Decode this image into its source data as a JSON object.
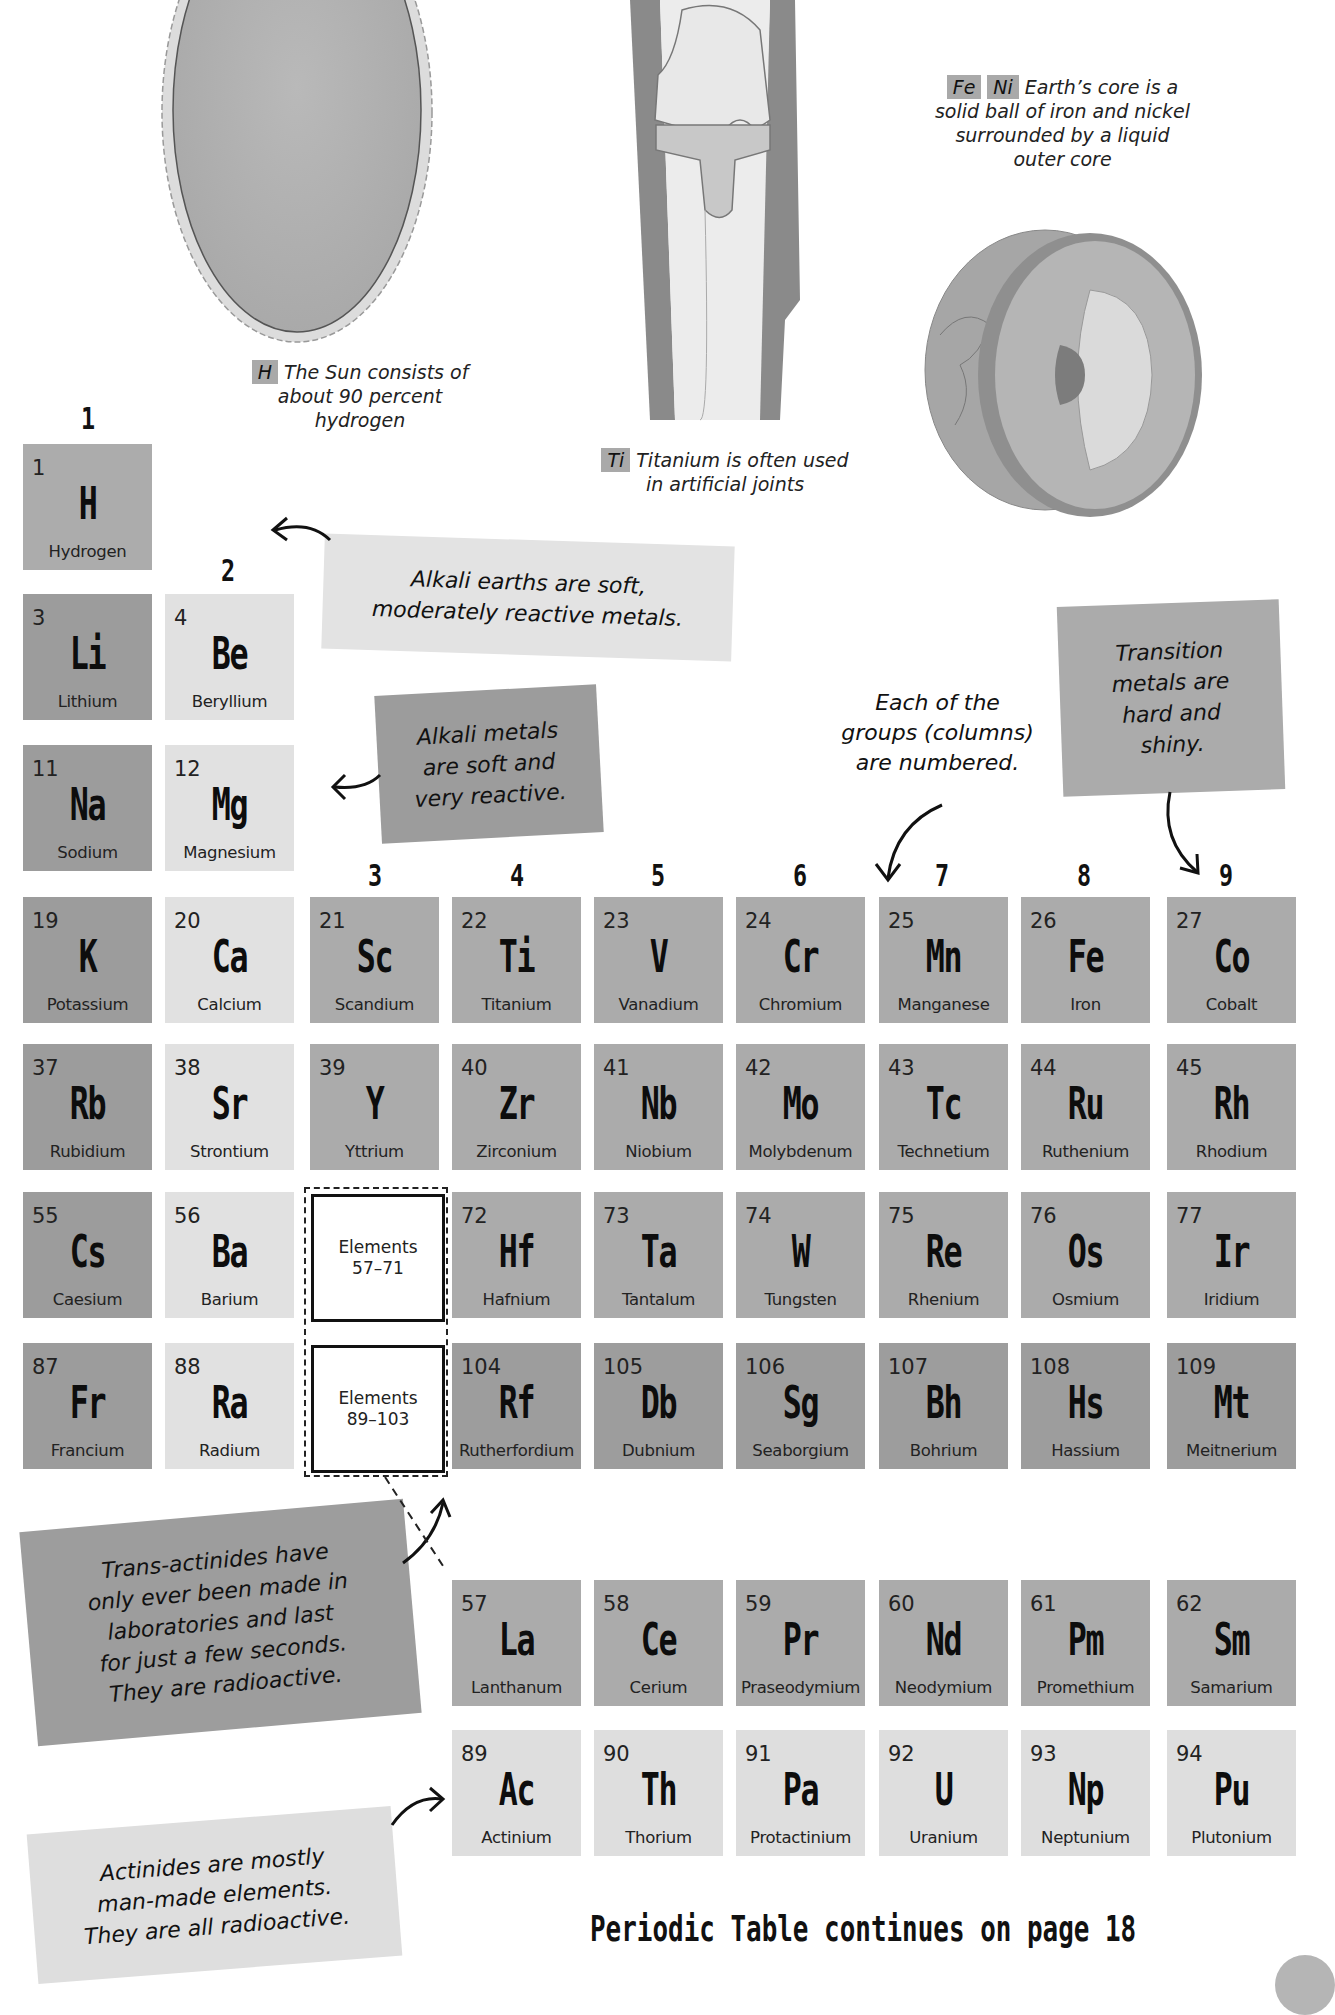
{
  "illustrations": {
    "sun": {
      "caption_chip": "H",
      "caption": "The Sun consists of about 90 percent hydrogen",
      "lines": [
        "The Sun consists of",
        "about 90 percent",
        "hydrogen"
      ]
    },
    "knee": {
      "caption_chip": "Ti",
      "lines": [
        "Titanium is often used",
        "in artificial joints"
      ]
    },
    "earth": {
      "caption_chips": [
        "Fe",
        "Ni"
      ],
      "lines": [
        "Earth’s core is a",
        "solid ball of iron and nickel",
        "surrounded by a liquid",
        "outer core"
      ]
    }
  },
  "group_numbers": [
    "1",
    "2",
    "3",
    "4",
    "5",
    "6",
    "7",
    "8",
    "9"
  ],
  "notes": {
    "alkali_earths": [
      "Alkali earths are soft,",
      "moderately reactive metals."
    ],
    "alkali_metals": [
      "Alkali metals",
      "are soft and",
      "very reactive."
    ],
    "groups_numbered": [
      "Each of the",
      "groups (columns)",
      "are numbered."
    ],
    "transition_metals": [
      "Transition",
      "metals are",
      "hard and",
      "shiny."
    ],
    "trans_actinides": [
      "Trans-actinides have",
      "only ever been made in",
      "laboratories and last",
      "for just a few seconds.",
      "They are radioactive."
    ],
    "actinides": [
      "Actinides are mostly",
      "man-made elements.",
      "They are all radioactive."
    ]
  },
  "placeholders": {
    "lanthanides": [
      "Elements",
      "57–71"
    ],
    "actinides": [
      "Elements",
      "89–103"
    ]
  },
  "elements": [
    {
      "num": "1",
      "sym": "H",
      "name": "Hydrogen",
      "cat": "h"
    },
    {
      "num": "3",
      "sym": "Li",
      "name": "Lithium",
      "cat": "alk"
    },
    {
      "num": "4",
      "sym": "Be",
      "name": "Beryllium",
      "cat": "ae"
    },
    {
      "num": "11",
      "sym": "Na",
      "name": "Sodium",
      "cat": "alk"
    },
    {
      "num": "12",
      "sym": "Mg",
      "name": "Magnesium",
      "cat": "ae"
    },
    {
      "num": "19",
      "sym": "K",
      "name": "Potassium",
      "cat": "alk"
    },
    {
      "num": "20",
      "sym": "Ca",
      "name": "Calcium",
      "cat": "ae"
    },
    {
      "num": "21",
      "sym": "Sc",
      "name": "Scandium",
      "cat": "tm"
    },
    {
      "num": "22",
      "sym": "Ti",
      "name": "Titanium",
      "cat": "tm"
    },
    {
      "num": "23",
      "sym": "V",
      "name": "Vanadium",
      "cat": "tm"
    },
    {
      "num": "24",
      "sym": "Cr",
      "name": "Chromium",
      "cat": "tm"
    },
    {
      "num": "25",
      "sym": "Mn",
      "name": "Manganese",
      "cat": "tm"
    },
    {
      "num": "26",
      "sym": "Fe",
      "name": "Iron",
      "cat": "tm"
    },
    {
      "num": "27",
      "sym": "Co",
      "name": "Cobalt",
      "cat": "tm"
    },
    {
      "num": "37",
      "sym": "Rb",
      "name": "Rubidium",
      "cat": "alk"
    },
    {
      "num": "38",
      "sym": "Sr",
      "name": "Strontium",
      "cat": "ae"
    },
    {
      "num": "39",
      "sym": "Y",
      "name": "Yttrium",
      "cat": "tm"
    },
    {
      "num": "40",
      "sym": "Zr",
      "name": "Zirconium",
      "cat": "tm"
    },
    {
      "num": "41",
      "sym": "Nb",
      "name": "Niobium",
      "cat": "tm"
    },
    {
      "num": "42",
      "sym": "Mo",
      "name": "Molybdenum",
      "cat": "tm"
    },
    {
      "num": "43",
      "sym": "Tc",
      "name": "Technetium",
      "cat": "tm"
    },
    {
      "num": "44",
      "sym": "Ru",
      "name": "Ruthenium",
      "cat": "tm"
    },
    {
      "num": "45",
      "sym": "Rh",
      "name": "Rhodium",
      "cat": "tm"
    },
    {
      "num": "55",
      "sym": "Cs",
      "name": "Caesium",
      "cat": "alk"
    },
    {
      "num": "56",
      "sym": "Ba",
      "name": "Barium",
      "cat": "ae"
    },
    {
      "num": "72",
      "sym": "Hf",
      "name": "Hafnium",
      "cat": "tm"
    },
    {
      "num": "73",
      "sym": "Ta",
      "name": "Tantalum",
      "cat": "tm"
    },
    {
      "num": "74",
      "sym": "W",
      "name": "Tungsten",
      "cat": "tm"
    },
    {
      "num": "75",
      "sym": "Re",
      "name": "Rhenium",
      "cat": "tm"
    },
    {
      "num": "76",
      "sym": "Os",
      "name": "Osmium",
      "cat": "tm"
    },
    {
      "num": "77",
      "sym": "Ir",
      "name": "Iridium",
      "cat": "tm"
    },
    {
      "num": "87",
      "sym": "Fr",
      "name": "Francium",
      "cat": "alk"
    },
    {
      "num": "88",
      "sym": "Ra",
      "name": "Radium",
      "cat": "ae"
    },
    {
      "num": "104",
      "sym": "Rf",
      "name": "Rutherfordium",
      "cat": "tact"
    },
    {
      "num": "105",
      "sym": "Db",
      "name": "Dubnium",
      "cat": "tact"
    },
    {
      "num": "106",
      "sym": "Sg",
      "name": "Seaborgium",
      "cat": "tact"
    },
    {
      "num": "107",
      "sym": "Bh",
      "name": "Bohrium",
      "cat": "tact"
    },
    {
      "num": "108",
      "sym": "Hs",
      "name": "Hassium",
      "cat": "tact"
    },
    {
      "num": "109",
      "sym": "Mt",
      "name": "Meitnerium",
      "cat": "tact"
    },
    {
      "num": "57",
      "sym": "La",
      "name": "Lanthanum",
      "cat": "lan"
    },
    {
      "num": "58",
      "sym": "Ce",
      "name": "Cerium",
      "cat": "lan"
    },
    {
      "num": "59",
      "sym": "Pr",
      "name": "Praseodymium",
      "cat": "lan"
    },
    {
      "num": "60",
      "sym": "Nd",
      "name": "Neodymium",
      "cat": "lan"
    },
    {
      "num": "61",
      "sym": "Pm",
      "name": "Promethium",
      "cat": "lan"
    },
    {
      "num": "62",
      "sym": "Sm",
      "name": "Samarium",
      "cat": "lan"
    },
    {
      "num": "89",
      "sym": "Ac",
      "name": "Actinium",
      "cat": "act"
    },
    {
      "num": "90",
      "sym": "Th",
      "name": "Thorium",
      "cat": "act"
    },
    {
      "num": "91",
      "sym": "Pa",
      "name": "Protactinium",
      "cat": "act"
    },
    {
      "num": "92",
      "sym": "U",
      "name": "Uranium",
      "cat": "act"
    },
    {
      "num": "93",
      "sym": "Np",
      "name": "Neptunium",
      "cat": "act"
    },
    {
      "num": "94",
      "sym": "Pu",
      "name": "Plutonium",
      "cat": "act"
    }
  ],
  "footer": {
    "text": "Periodic Table continues on page 18"
  },
  "colors": {
    "hydrogen": "#acacac",
    "alkali_metal": "#9c9c9c",
    "alkaline_earth": "#e1e1e1",
    "transition_metal": "#ababab",
    "trans_actinide": "#9d9d9d",
    "lanthanide": "#ababab",
    "actinide": "#dedede"
  }
}
